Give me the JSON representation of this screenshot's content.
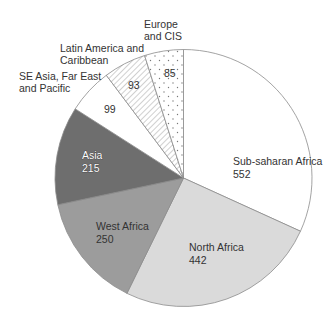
{
  "chart_data": {
    "type": "pie",
    "title": "",
    "start_angle_deg": 0,
    "direction": "clockwise",
    "total": 1736,
    "slices": [
      {
        "label": "Sub-saharan Africa",
        "value": 552,
        "fill": "#ffffff",
        "pattern": "none"
      },
      {
        "label": "North Africa",
        "value": 442,
        "fill": "#dadada",
        "pattern": "none"
      },
      {
        "label": "West Africa",
        "value": 250,
        "fill": "#9c9c9c",
        "pattern": "none"
      },
      {
        "label": "Asia",
        "value": 215,
        "fill": "#6e6e6e",
        "pattern": "none"
      },
      {
        "label": "SE Asia, Far East and Pacific",
        "value": 99,
        "fill": "#ffffff",
        "pattern": "none"
      },
      {
        "label": "Latin America and Caribbean",
        "value": 93,
        "fill": "#ffffff",
        "pattern": "diagonal-hatch"
      },
      {
        "label": "Europe and CIS",
        "value": 85,
        "fill": "#ffffff",
        "pattern": "dots"
      }
    ],
    "legend": null
  },
  "labels": {
    "sub_saharan": {
      "name": "Sub-saharan Africa",
      "value": "552"
    },
    "north_africa": {
      "name": "North Africa",
      "value": "442"
    },
    "west_africa": {
      "name": "West Africa",
      "value": "250"
    },
    "asia": {
      "name": "Asia",
      "value": "215"
    },
    "se_asia": {
      "name_line1": "SE Asia, Far East",
      "name_line2": "and Pacific",
      "value": "99"
    },
    "latin": {
      "name_line1": "Latin America and",
      "name_line2": "Caribbean",
      "value": "93"
    },
    "europe": {
      "name_line1": "Europe",
      "name_line2": "and CIS",
      "value": "85"
    }
  }
}
